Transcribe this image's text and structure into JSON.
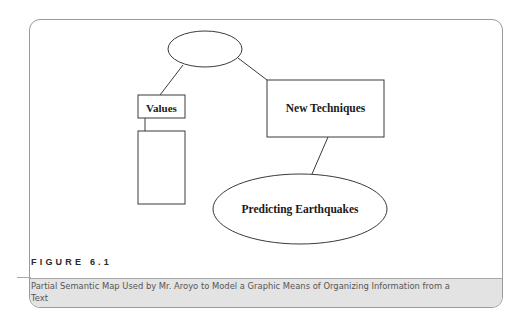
{
  "figure": {
    "label": "FIGURE 6.1",
    "caption": "Partial Semantic Map Used by Mr. Aroyo to Model a Graphic Means of Organizing Information from a Text"
  },
  "diagram": {
    "nodes": [
      {
        "id": "top",
        "shape": "ellipse",
        "label": ""
      },
      {
        "id": "values",
        "shape": "rect",
        "label": "Values"
      },
      {
        "id": "values-child",
        "shape": "rect",
        "label": ""
      },
      {
        "id": "new-techniques",
        "shape": "rect",
        "label": "New Techniques"
      },
      {
        "id": "predicting",
        "shape": "ellipse",
        "label": "Predicting Earthquakes"
      }
    ],
    "edges": [
      {
        "from": "top",
        "to": "values"
      },
      {
        "from": "top",
        "to": "new-techniques"
      },
      {
        "from": "values",
        "to": "values-child"
      },
      {
        "from": "new-techniques",
        "to": "predicting"
      }
    ]
  },
  "colors": {
    "stroke": "#3a3a3a",
    "caption_band": "#e3e3e3",
    "card_border": "#9a9a9a"
  }
}
